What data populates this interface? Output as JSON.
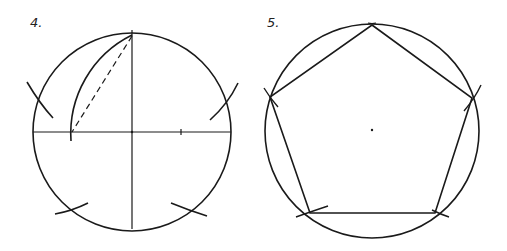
{
  "figures": [
    {
      "label": "4.",
      "description": "Circle with perpendicular diameters; arc swung from midpoint of radius through top point; dashed chord; five arc marks on circle"
    },
    {
      "label": "5.",
      "description": "Regular pentagon inscribed in circle with center point"
    }
  ],
  "colors": {
    "stroke": "#1a1a1a",
    "background": "#ffffff"
  }
}
